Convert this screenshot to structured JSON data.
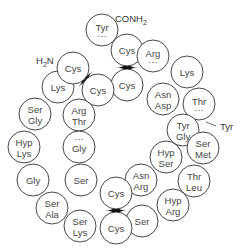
{
  "diagram": {
    "terminal_labels": {
      "c_terminus": "CONH2",
      "n_terminus": "H2N",
      "side_label": "Tyr"
    },
    "residues": [
      {
        "id": "r1",
        "x": 102,
        "y": 30,
        "lines": [
          "Tyr"
        ],
        "dots": "below"
      },
      {
        "id": "r2",
        "x": 127,
        "y": 50,
        "lines": [
          "Cys"
        ]
      },
      {
        "id": "r3",
        "x": 127,
        "y": 85,
        "lines": [
          "Cys"
        ]
      },
      {
        "id": "r4",
        "x": 153,
        "y": 56,
        "lines": [
          "Arg"
        ],
        "dots": "below"
      },
      {
        "id": "r5",
        "x": 187,
        "y": 72,
        "lines": [
          "Lys"
        ]
      },
      {
        "id": "r6",
        "x": 199,
        "y": 104,
        "lines": [
          "Thr"
        ],
        "dots": "below"
      },
      {
        "id": "r7",
        "x": 163,
        "y": 99,
        "lines": [
          "Asn",
          "Asp"
        ]
      },
      {
        "id": "r8",
        "x": 183,
        "y": 130,
        "lines": [
          "Tyr",
          "Gly"
        ]
      },
      {
        "id": "r9",
        "x": 203,
        "y": 148,
        "lines": [
          "Ser",
          "Met"
        ]
      },
      {
        "id": "r10",
        "x": 166,
        "y": 157,
        "lines": [
          "Hyp",
          "Ser"
        ]
      },
      {
        "id": "r11",
        "x": 194,
        "y": 181,
        "lines": [
          "Thr",
          "Leu"
        ]
      },
      {
        "id": "r12",
        "x": 141,
        "y": 180,
        "lines": [
          "Asn",
          "Arg"
        ]
      },
      {
        "id": "r13",
        "x": 173,
        "y": 205,
        "lines": [
          "Hyp",
          "Arg"
        ]
      },
      {
        "id": "r14",
        "x": 142,
        "y": 221,
        "lines": [
          "Ser"
        ]
      },
      {
        "id": "r15",
        "x": 116,
        "y": 193,
        "lines": [
          "Cys"
        ]
      },
      {
        "id": "r16",
        "x": 116,
        "y": 228,
        "lines": [
          "Cys"
        ]
      },
      {
        "id": "r17",
        "x": 80,
        "y": 226,
        "lines": [
          "Ser",
          "Lys"
        ]
      },
      {
        "id": "r18",
        "x": 52,
        "y": 208,
        "lines": [
          "Ser",
          "Ala"
        ]
      },
      {
        "id": "r19",
        "x": 33,
        "y": 180,
        "lines": [
          "Gly"
        ]
      },
      {
        "id": "r20",
        "x": 24,
        "y": 147,
        "lines": [
          "Hyp",
          "Lys"
        ]
      },
      {
        "id": "r21",
        "x": 35,
        "y": 114,
        "lines": [
          "Ser",
          "Gly"
        ]
      },
      {
        "id": "r22",
        "x": 58,
        "y": 87,
        "lines": [
          "Lys"
        ]
      },
      {
        "id": "r23",
        "x": 73,
        "y": 68,
        "lines": [
          "Cys"
        ]
      },
      {
        "id": "r24",
        "x": 98,
        "y": 90,
        "lines": [
          "Cys"
        ]
      },
      {
        "id": "r25",
        "x": 79,
        "y": 115,
        "lines": [
          "Arg",
          "Thr"
        ]
      },
      {
        "id": "r26",
        "x": 79,
        "y": 147,
        "lines": [
          "Gly"
        ],
        "dots": "above"
      },
      {
        "id": "r27",
        "x": 81,
        "y": 180,
        "lines": [
          "Ser"
        ]
      }
    ],
    "disulfide_bridges": [
      {
        "from": "r23",
        "to": "r24"
      },
      {
        "from": "r2",
        "to": "r3"
      },
      {
        "from": "r15",
        "to": "r16"
      }
    ],
    "colors": {
      "stroke": "#333333",
      "text": "#444444",
      "bridge": "#111111",
      "background": "#ffffff"
    }
  }
}
